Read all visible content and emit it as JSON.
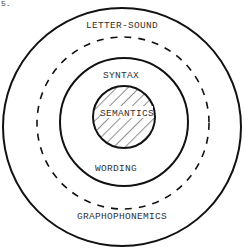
{
  "figure": {
    "corner_fragment": "5.",
    "rings": [
      {
        "id": "outer",
        "style": "solid",
        "top_label": "LETTER-SOUND",
        "bottom_label": "GRAPHOPHONEMICS"
      },
      {
        "id": "dashed",
        "style": "dashed"
      },
      {
        "id": "middle",
        "style": "solid",
        "top_label": "SYNTAX",
        "bottom_label": "WORDING"
      },
      {
        "id": "core",
        "style": "hatched",
        "label": "SEMANTICS"
      }
    ],
    "colors": {
      "stroke": "#111111",
      "text": "#333333",
      "background": "#ffffff"
    }
  }
}
